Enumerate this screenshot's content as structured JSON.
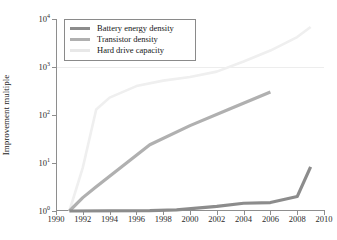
{
  "chart_data": {
    "type": "line",
    "title": "",
    "xlabel": "",
    "ylabel": "Improvement multiple",
    "xlim": [
      1990,
      2010
    ],
    "ylim": [
      1,
      10000
    ],
    "yscale": "log",
    "grid": "horizontal-faint",
    "legend_position": "upper-left-inside",
    "x_ticks": [
      "1990",
      "1992",
      "1994",
      "1996",
      "1998",
      "2000",
      "2002",
      "2004",
      "2006",
      "2008",
      "2010"
    ],
    "x_tick_values": [
      1990,
      1992,
      1994,
      1996,
      1998,
      2000,
      2002,
      2004,
      2006,
      2008,
      2010
    ],
    "y_ticks": [
      "10^0",
      "10^1",
      "10^2",
      "10^3",
      "10^4"
    ],
    "y_tick_values": [
      1,
      10,
      100,
      1000,
      10000
    ],
    "y_tick_mantissa": [
      "10",
      "10",
      "10",
      "10",
      "10"
    ],
    "y_tick_exponent": [
      "0",
      "1",
      "2",
      "3",
      "4"
    ],
    "series": [
      {
        "name": "Battery energy density",
        "color": "#8c8c8c",
        "width": 3.2,
        "x": [
          1991,
          1997,
          1999,
          2002,
          2004,
          2006,
          2008,
          2009
        ],
        "values": [
          1.0,
          1.02,
          1.06,
          1.25,
          1.45,
          1.5,
          2.0,
          8.3
        ]
      },
      {
        "name": "Transistor density",
        "color": "#b0b0b0",
        "width": 3.2,
        "x": [
          1991,
          1992,
          1993,
          1997,
          2000,
          2003,
          2006
        ],
        "values": [
          1.0,
          1.9,
          3.2,
          24.0,
          60.0,
          135.0,
          300.0
        ]
      },
      {
        "name": "Hard drive capacity",
        "color": "#efefef",
        "width": 2.6,
        "x": [
          1991,
          1992,
          1993,
          1994,
          1996,
          1998,
          2000,
          2002,
          2004,
          2006,
          2008,
          2009
        ],
        "values": [
          1.0,
          8.0,
          130.0,
          230.0,
          400.0,
          520.0,
          620.0,
          800.0,
          1300.0,
          2200.0,
          4200.0,
          6800.0
        ]
      }
    ]
  },
  "legend": {
    "items": [
      {
        "label": "Battery energy density",
        "color": "#8c8c8c"
      },
      {
        "label": "Transistor density",
        "color": "#b0b0b0"
      },
      {
        "label": "Hard drive capacity",
        "color": "#e8e8e8"
      }
    ]
  },
  "axes": {
    "y_title": "Improvement multiple"
  }
}
